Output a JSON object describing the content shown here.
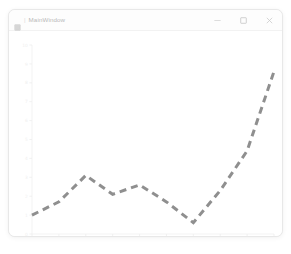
{
  "window": {
    "title": "MainWindow",
    "icon": "app-icon",
    "separator": "|",
    "controls": [
      {
        "name": "minimize",
        "label": "minimize-icon"
      },
      {
        "name": "maximize",
        "label": "maximize-icon"
      },
      {
        "name": "close",
        "label": "close-icon"
      }
    ]
  },
  "colors": {
    "line": "#8f8f8f",
    "axis": "#f0f0f0",
    "tick_text": "#efefef",
    "window_bg": "#ffffff",
    "titlebar_bg": "#fdfdfd",
    "border": "#e8e8e8",
    "title_text": "#b9b9b9"
  },
  "chart_data": {
    "type": "line",
    "title": "",
    "xlabel": "",
    "ylabel": "",
    "x": [
      0,
      1,
      2,
      3,
      4,
      5,
      6,
      7,
      8,
      9
    ],
    "values": [
      1.0,
      1.7,
      3.1,
      2.1,
      2.6,
      1.7,
      0.6,
      2.3,
      4.4,
      8.6
    ],
    "xlim": [
      0,
      9
    ],
    "ylim": [
      0,
      10
    ],
    "xticks": [
      0,
      1,
      2,
      3,
      4,
      5,
      6,
      7,
      8,
      9
    ],
    "xtick_labels": [
      "0",
      "1",
      "2",
      "3",
      "4",
      "5",
      "6",
      "7",
      "8",
      "9"
    ],
    "yticks": [
      0,
      1,
      2,
      3,
      4,
      5,
      6,
      7,
      8,
      9,
      10
    ],
    "ytick_labels": [
      "0",
      "1",
      "2",
      "3",
      "4",
      "5",
      "6",
      "7",
      "8",
      "9",
      "10"
    ],
    "grid": false,
    "legend": null,
    "series": [
      {
        "name": "series-1",
        "linestyle": "dashed",
        "color": "#8f8f8f",
        "linewidth": 3,
        "dash_pattern": "7 5",
        "values": [
          1.0,
          1.7,
          3.1,
          2.1,
          2.6,
          1.7,
          0.6,
          2.3,
          4.4,
          8.6
        ]
      }
    ]
  }
}
